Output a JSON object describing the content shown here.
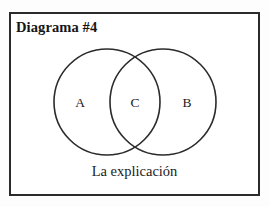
{
  "figure": {
    "title": "Diagrama #4",
    "caption": "La explicación",
    "background_color": "#ffffff",
    "frame_color": "#2b2b2b",
    "stroke_color": "#2b2b2b"
  },
  "chart_data": {
    "type": "diagram",
    "diagram_type": "venn",
    "title": "Diagrama #4",
    "caption": "La explicación",
    "set_count": 2,
    "regions": [
      {
        "id": "A",
        "label": "A",
        "description": "left-circle-only"
      },
      {
        "id": "C",
        "label": "C",
        "description": "intersection"
      },
      {
        "id": "B",
        "label": "B",
        "description": "right-circle-only"
      }
    ],
    "circles": [
      {
        "id": "left",
        "label": "A",
        "cx": 107,
        "cy": 102,
        "r": 53
      },
      {
        "id": "right",
        "label": "B",
        "cx": 163,
        "cy": 102,
        "r": 53
      }
    ],
    "fill": "none",
    "stroke": "#2b2b2b",
    "stroke_width": 1.6,
    "grid": false,
    "legend": false
  }
}
